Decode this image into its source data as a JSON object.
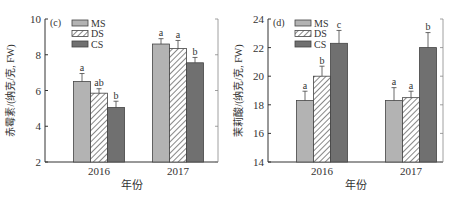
{
  "colors": {
    "MS": "#b3b3b3",
    "DS_bg": "#ffffff",
    "DS_hatch": "#555555",
    "CS": "#707070",
    "axis": "#333333",
    "text": "#333333"
  },
  "legend": [
    "MS",
    "DS",
    "CS"
  ],
  "chart_data": [
    {
      "type": "bar",
      "panel_label": "(c)",
      "title": "",
      "xlabel": "年份",
      "ylabel": "赤霉素/(纳克/克, FW)",
      "categories": [
        "2016",
        "2017"
      ],
      "ylim": [
        2,
        10
      ],
      "yticks": [
        2,
        4,
        6,
        8,
        10
      ],
      "grid": false,
      "legend_position": "upper-left",
      "series": [
        {
          "name": "MS",
          "values": [
            6.5,
            8.6
          ],
          "errors": [
            0.45,
            0.3
          ],
          "letters": [
            "a",
            "a"
          ]
        },
        {
          "name": "DS",
          "values": [
            5.85,
            8.35
          ],
          "errors": [
            0.25,
            0.45
          ],
          "letters": [
            "ab",
            "a"
          ]
        },
        {
          "name": "CS",
          "values": [
            5.05,
            7.55
          ],
          "errors": [
            0.35,
            0.3
          ],
          "letters": [
            "b",
            "b"
          ]
        }
      ]
    },
    {
      "type": "bar",
      "panel_label": "(d)",
      "title": "",
      "xlabel": "年份",
      "ylabel": "茉莉酸/(纳克/克, FW)",
      "categories": [
        "2016",
        "2017"
      ],
      "ylim": [
        14,
        24
      ],
      "yticks": [
        14,
        16,
        18,
        20,
        22,
        24
      ],
      "grid": false,
      "legend_position": "upper-left",
      "series": [
        {
          "name": "MS",
          "values": [
            18.3,
            18.3
          ],
          "errors": [
            0.65,
            0.9
          ],
          "letters": [
            "a",
            "a"
          ]
        },
        {
          "name": "DS",
          "values": [
            20.0,
            18.5
          ],
          "errors": [
            0.7,
            0.45
          ],
          "letters": [
            "b",
            "a"
          ]
        },
        {
          "name": "CS",
          "values": [
            22.3,
            22.0
          ],
          "errors": [
            0.9,
            1.05
          ],
          "letters": [
            "c",
            "b"
          ]
        }
      ]
    }
  ]
}
